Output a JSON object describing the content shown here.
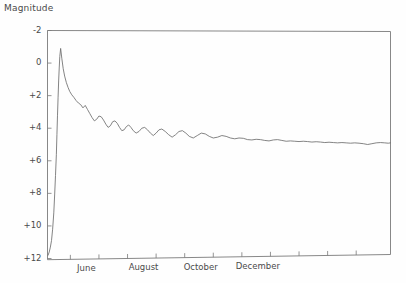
{
  "chart_data": {
    "type": "line",
    "title": "",
    "subtitle": "",
    "xlabel": "",
    "ylabel": "Magnitude",
    "y_inverted": true,
    "ylim": [
      -2,
      12
    ],
    "y_ticks": [
      -2,
      0,
      2,
      4,
      6,
      8,
      10,
      12
    ],
    "y_tick_labels": [
      "-2",
      "0",
      "+2",
      "+4",
      "+6",
      "+8",
      "+10",
      "+12"
    ],
    "xlim": [
      0,
      12
    ],
    "x_ticks": [
      0.8,
      1.8,
      2.8,
      3.8,
      4.8,
      5.8,
      6.8,
      7.8,
      8.8,
      9.8,
      10.8
    ],
    "x_tick_labels": [
      "June",
      "August",
      "October",
      "December"
    ],
    "x_labeled_ticks": [
      0.8,
      2.8,
      4.8,
      6.8
    ],
    "grid": false,
    "legend": false,
    "legend_position": "none",
    "series": [
      {
        "name": "Light curve",
        "color": "#6e6e6e",
        "x": [
          0.02,
          0.06,
          0.1,
          0.14,
          0.18,
          0.22,
          0.25,
          0.28,
          0.31,
          0.33,
          0.35,
          0.37,
          0.39,
          0.41,
          0.43,
          0.46,
          0.5,
          0.55,
          0.6,
          0.66,
          0.72,
          0.78,
          0.85,
          0.92,
          1.0,
          1.08,
          1.16,
          1.24,
          1.32,
          1.4,
          1.48,
          1.56,
          1.64,
          1.72,
          1.8,
          1.88,
          1.96,
          2.04,
          2.12,
          2.2,
          2.28,
          2.36,
          2.44,
          2.52,
          2.6,
          2.68,
          2.76,
          2.84,
          2.92,
          3.0,
          3.1,
          3.2,
          3.3,
          3.4,
          3.5,
          3.6,
          3.7,
          3.8,
          3.9,
          4.0,
          4.12,
          4.24,
          4.36,
          4.48,
          4.6,
          4.72,
          4.84,
          4.96,
          5.1,
          5.24,
          5.38,
          5.52,
          5.66,
          5.8,
          5.95,
          6.1,
          6.25,
          6.4,
          6.55,
          6.7,
          6.85,
          7.0,
          7.15,
          7.3,
          7.45,
          7.6,
          7.75,
          7.9,
          8.05,
          8.2,
          8.35,
          8.5,
          8.65,
          8.8,
          8.95,
          9.1,
          9.25,
          9.4,
          9.55,
          9.7,
          9.85,
          10.0,
          10.15,
          10.3,
          10.45,
          10.6,
          10.75,
          10.9,
          11.05,
          11.2,
          11.35,
          11.5,
          11.65,
          11.8,
          11.92,
          12.0
        ],
        "y": [
          11.8,
          11.6,
          11.3,
          10.9,
          10.2,
          9.2,
          8.1,
          6.9,
          5.6,
          4.4,
          3.2,
          2.1,
          1.1,
          0.3,
          -0.4,
          -0.9,
          -0.3,
          0.35,
          0.8,
          1.2,
          1.5,
          1.75,
          1.95,
          2.1,
          2.3,
          2.45,
          2.55,
          2.75,
          2.6,
          2.85,
          3.1,
          3.35,
          3.55,
          3.45,
          3.25,
          3.3,
          3.5,
          3.75,
          3.95,
          3.85,
          3.6,
          3.55,
          3.7,
          3.95,
          4.15,
          4.1,
          3.9,
          3.8,
          3.95,
          4.15,
          4.3,
          4.2,
          4.0,
          3.95,
          4.1,
          4.3,
          4.45,
          4.3,
          4.1,
          4.05,
          4.2,
          4.4,
          4.55,
          4.4,
          4.2,
          4.15,
          4.3,
          4.5,
          4.6,
          4.45,
          4.3,
          4.35,
          4.5,
          4.6,
          4.55,
          4.45,
          4.5,
          4.6,
          4.65,
          4.6,
          4.62,
          4.7,
          4.72,
          4.68,
          4.7,
          4.75,
          4.78,
          4.72,
          4.7,
          4.75,
          4.8,
          4.78,
          4.8,
          4.82,
          4.8,
          4.82,
          4.85,
          4.83,
          4.85,
          4.88,
          4.86,
          4.88,
          4.9,
          4.88,
          4.9,
          4.92,
          4.9,
          4.92,
          4.95,
          5.0,
          4.95,
          4.9,
          4.88,
          4.9,
          4.92,
          4.9
        ]
      }
    ]
  },
  "axis": {
    "y_title": "Magnitude"
  }
}
